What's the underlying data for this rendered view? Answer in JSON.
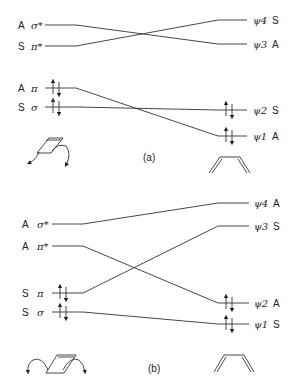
{
  "panels": [
    {
      "caption": "(a)",
      "left_orbitals": [
        {
          "sym": "A",
          "name": "σ*",
          "y": 25
        },
        {
          "sym": "S",
          "name": "π*",
          "y": 46
        },
        {
          "sym": "A",
          "name": "π",
          "y": 88,
          "electrons": 2
        },
        {
          "sym": "S",
          "name": "σ",
          "y": 107,
          "electrons": 2
        }
      ],
      "right_orbitals": [
        {
          "name": "ψ4",
          "sym": "S",
          "y": 20
        },
        {
          "name": "ψ3",
          "sym": "A",
          "y": 44
        },
        {
          "name": "ψ2",
          "sym": "S",
          "y": 110,
          "electrons": 2
        },
        {
          "name": "ψ1",
          "sym": "A",
          "y": 136,
          "electrons": 2
        }
      ],
      "correlations": [
        {
          "from": "σ*",
          "to": "ψ3"
        },
        {
          "from": "π*",
          "to": "ψ4"
        },
        {
          "from": "π",
          "to": "ψ1"
        },
        {
          "from": "σ",
          "to": "ψ2"
        }
      ],
      "left_molecule": "cyclobutene-conrotatory",
      "right_molecule": "butadiene"
    },
    {
      "caption": "(b)",
      "left_orbitals": [
        {
          "sym": "A",
          "name": "σ*",
          "y": 224
        },
        {
          "sym": "A",
          "name": "π*",
          "y": 246
        },
        {
          "sym": "S",
          "name": "π",
          "y": 293,
          "electrons": 2
        },
        {
          "sym": "S",
          "name": "σ",
          "y": 312,
          "electrons": 2
        }
      ],
      "right_orbitals": [
        {
          "name": "ψ4",
          "sym": "A",
          "y": 203
        },
        {
          "name": "ψ3",
          "sym": "S",
          "y": 226
        },
        {
          "name": "ψ2",
          "sym": "A",
          "y": 303,
          "electrons": 2
        },
        {
          "name": "ψ1",
          "sym": "S",
          "y": 324,
          "electrons": 2
        }
      ],
      "correlations": [
        {
          "from": "σ*",
          "to": "ψ4"
        },
        {
          "from": "π*",
          "to": "ψ2"
        },
        {
          "from": "π",
          "to": "ψ3"
        },
        {
          "from": "σ",
          "to": "ψ1"
        }
      ],
      "left_molecule": "cyclobutene-disrotatory",
      "right_molecule": "butadiene"
    }
  ]
}
